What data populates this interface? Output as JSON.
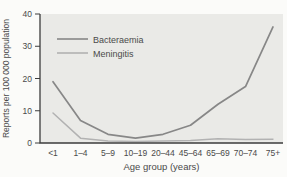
{
  "chart_data": {
    "type": "line",
    "title": "",
    "xlabel": "Age group (years)",
    "ylabel": "Reports per 100 000 population",
    "categories": [
      "<1",
      "1–4",
      "5–9",
      "10–19",
      "20–44",
      "45–64",
      "65–69",
      "70–74",
      "75+"
    ],
    "series": [
      {
        "name": "Bacteraemia",
        "color": "#878787",
        "values": [
          19,
          7,
          2.7,
          1.5,
          2.7,
          5.5,
          12,
          17.5,
          36
        ]
      },
      {
        "name": "Meningitis",
        "color": "#b2b2b2",
        "values": [
          9.3,
          1.5,
          0.6,
          0.5,
          0.6,
          0.8,
          1.3,
          1.1,
          1.2
        ]
      }
    ],
    "yticks": [
      0,
      10,
      20,
      30,
      40
    ],
    "ylim": [
      0,
      40
    ],
    "grid": false,
    "legend_position": "upper-left",
    "colors": {
      "plot_bg": "#eaeae7",
      "page_bg": "#fbfbf9",
      "axis": "#3c3c3c",
      "text": "#4a4a4a"
    }
  }
}
